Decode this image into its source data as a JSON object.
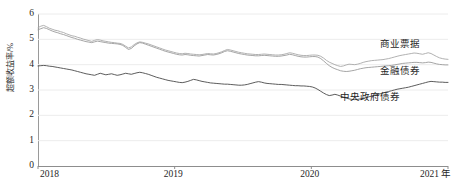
{
  "chart_data": {
    "type": "line",
    "title": "",
    "xlabel": "",
    "ylabel": "超额收益率/%",
    "x_unit_suffix": "年",
    "xlim": [
      2018,
      2021
    ],
    "ylim": [
      0,
      6
    ],
    "grid": true,
    "grid_axis": "y",
    "legend_position": "inline-right",
    "x_ticks": [
      "2018",
      "2019",
      "2020",
      "2021"
    ],
    "y_ticks": [
      "0",
      "1",
      "2",
      "3",
      "4",
      "5",
      "6"
    ],
    "series": [
      {
        "name": "商业票据",
        "color": "#a8a8a8",
        "label_x_px": 380,
        "label_y_px": 40,
        "values": [
          5.46,
          5.52,
          5.55,
          5.5,
          5.44,
          5.4,
          5.36,
          5.34,
          5.3,
          5.27,
          5.22,
          5.18,
          5.14,
          5.12,
          5.08,
          5.05,
          5.01,
          4.98,
          4.95,
          4.92,
          4.96,
          4.99,
          4.97,
          4.94,
          4.92,
          4.9,
          4.88,
          4.87,
          4.85,
          4.84,
          4.8,
          4.73,
          4.66,
          4.7,
          4.79,
          4.86,
          4.9,
          4.88,
          4.85,
          4.82,
          4.78,
          4.74,
          4.7,
          4.66,
          4.62,
          4.58,
          4.55,
          4.52,
          4.49,
          4.46,
          4.44,
          4.43,
          4.45,
          4.44,
          4.42,
          4.41,
          4.4,
          4.39,
          4.4,
          4.42,
          4.44,
          4.43,
          4.42,
          4.44,
          4.47,
          4.51,
          4.56,
          4.6,
          4.58,
          4.55,
          4.52,
          4.49,
          4.47,
          4.45,
          4.43,
          4.42,
          4.41,
          4.4,
          4.4,
          4.41,
          4.42,
          4.41,
          4.4,
          4.39,
          4.38,
          4.38,
          4.39,
          4.41,
          4.44,
          4.47,
          4.45,
          4.42,
          4.39,
          4.37,
          4.36,
          4.36,
          4.37,
          4.38,
          4.38,
          4.37,
          4.33,
          4.26,
          4.17,
          4.1,
          4.05,
          4.0,
          3.96,
          3.93,
          3.95,
          3.99,
          4.02,
          4.01,
          4.0,
          4.02,
          4.05,
          4.09,
          4.12,
          4.14,
          4.16,
          4.17,
          4.18,
          4.19,
          4.2,
          4.22,
          4.24,
          4.27,
          4.3,
          4.33,
          4.36,
          4.38,
          4.4,
          4.42,
          4.44,
          4.46,
          4.45,
          4.43,
          4.41,
          4.44,
          4.47,
          4.44,
          4.38,
          4.32,
          4.27,
          4.24,
          4.22,
          4.21
        ]
      },
      {
        "name": "金融债券",
        "color": "#9b9b9b",
        "label_x_px": 380,
        "label_y_px": 67,
        "values": [
          5.38,
          5.42,
          5.46,
          5.43,
          5.38,
          5.33,
          5.29,
          5.26,
          5.22,
          5.19,
          5.15,
          5.11,
          5.07,
          5.04,
          5.0,
          4.97,
          4.94,
          4.91,
          4.89,
          4.87,
          4.9,
          4.93,
          4.91,
          4.89,
          4.87,
          4.85,
          4.84,
          4.83,
          4.82,
          4.8,
          4.76,
          4.68,
          4.6,
          4.64,
          4.74,
          4.82,
          4.87,
          4.85,
          4.81,
          4.77,
          4.73,
          4.69,
          4.65,
          4.61,
          4.57,
          4.53,
          4.5,
          4.47,
          4.44,
          4.41,
          4.39,
          4.38,
          4.4,
          4.39,
          4.37,
          4.36,
          4.35,
          4.34,
          4.36,
          4.38,
          4.4,
          4.39,
          4.38,
          4.4,
          4.43,
          4.47,
          4.52,
          4.55,
          4.53,
          4.5,
          4.47,
          4.44,
          4.42,
          4.4,
          4.38,
          4.37,
          4.36,
          4.35,
          4.35,
          4.36,
          4.37,
          4.36,
          4.35,
          4.34,
          4.33,
          4.33,
          4.34,
          4.36,
          4.38,
          4.41,
          4.39,
          4.36,
          4.33,
          4.31,
          4.3,
          4.3,
          4.31,
          4.32,
          4.32,
          4.3,
          4.24,
          4.15,
          4.05,
          3.96,
          3.89,
          3.84,
          3.8,
          3.76,
          3.74,
          3.73,
          3.74,
          3.76,
          3.78,
          3.81,
          3.84,
          3.86,
          3.88,
          3.89,
          3.9,
          3.91,
          3.92,
          3.93,
          3.94,
          3.95,
          3.96,
          3.97,
          3.99,
          4.01,
          4.03,
          4.05,
          4.06,
          4.07,
          4.08,
          4.09,
          4.09,
          4.08,
          4.07,
          4.08,
          4.1,
          4.09,
          4.06,
          4.03,
          4.01,
          4.0,
          3.99,
          3.99
        ]
      },
      {
        "name": "中央政府债券",
        "color": "#4a4a4a",
        "label_x_px": 340,
        "label_y_px": 93,
        "values": [
          3.95,
          3.96,
          3.97,
          3.96,
          3.94,
          3.93,
          3.91,
          3.89,
          3.87,
          3.85,
          3.83,
          3.81,
          3.79,
          3.76,
          3.73,
          3.7,
          3.67,
          3.64,
          3.62,
          3.6,
          3.58,
          3.62,
          3.66,
          3.63,
          3.6,
          3.62,
          3.64,
          3.61,
          3.58,
          3.6,
          3.63,
          3.66,
          3.64,
          3.62,
          3.65,
          3.68,
          3.7,
          3.68,
          3.65,
          3.62,
          3.58,
          3.54,
          3.5,
          3.47,
          3.44,
          3.41,
          3.38,
          3.36,
          3.34,
          3.32,
          3.3,
          3.29,
          3.31,
          3.34,
          3.38,
          3.42,
          3.4,
          3.37,
          3.34,
          3.32,
          3.3,
          3.28,
          3.27,
          3.26,
          3.25,
          3.24,
          3.23,
          3.23,
          3.22,
          3.21,
          3.2,
          3.19,
          3.19,
          3.2,
          3.22,
          3.25,
          3.28,
          3.31,
          3.33,
          3.31,
          3.28,
          3.26,
          3.25,
          3.24,
          3.23,
          3.22,
          3.22,
          3.21,
          3.2,
          3.19,
          3.18,
          3.17,
          3.17,
          3.16,
          3.16,
          3.15,
          3.14,
          3.12,
          3.08,
          3.02,
          2.95,
          2.88,
          2.82,
          2.78,
          2.8,
          2.83,
          2.8,
          2.76,
          2.72,
          2.68,
          2.65,
          2.63,
          2.62,
          2.63,
          2.65,
          2.67,
          2.7,
          2.73,
          2.76,
          2.79,
          2.82,
          2.85,
          2.88,
          2.91,
          2.94,
          2.97,
          3.0,
          3.03,
          3.05,
          3.07,
          3.09,
          3.11,
          3.14,
          3.17,
          3.2,
          3.23,
          3.26,
          3.29,
          3.32,
          3.34,
          3.33,
          3.32,
          3.31,
          3.31,
          3.3,
          3.3
        ]
      }
    ]
  }
}
